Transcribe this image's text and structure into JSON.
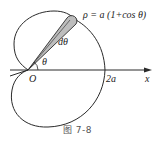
{
  "figure": {
    "formula": "ρ = a (1+cos θ)",
    "wedge_label": "dθ",
    "angle_label": "θ",
    "origin_label": "O",
    "intercept_label": "2a",
    "axis_label": "x",
    "caption": "图   7-8"
  },
  "colors": {
    "stroke": "#2a2a2a",
    "wedge_fill": "#bdbdbd",
    "background": "#ffffff"
  }
}
